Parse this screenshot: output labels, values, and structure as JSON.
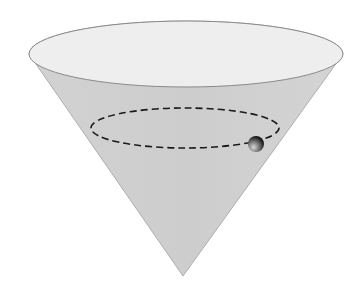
{
  "diagram": {
    "colors": {
      "background": "#ffffff",
      "cone_body": "#cfcfcf",
      "cone_top": "#eeeeee",
      "outline": "#8a8a8a",
      "dashed_path": "#1a1a1a",
      "ball_dark": "#111111",
      "ball_light": "#bdbdbd"
    },
    "cone": {
      "top_center": [
        186,
        54
      ],
      "top_rx": 157,
      "top_ry": 33,
      "apex": [
        183,
        276
      ]
    },
    "path": {
      "center": [
        185,
        128
      ],
      "rx": 94,
      "ry": 20,
      "style": "dashed"
    },
    "ball": {
      "center": [
        256,
        144
      ],
      "r": 8
    }
  }
}
